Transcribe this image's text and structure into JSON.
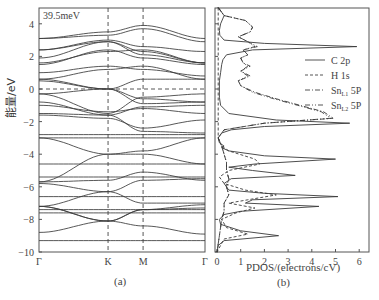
{
  "figure": {
    "panel_a_label": "(a)",
    "panel_b_label": "(b)",
    "annotation": "39.5meV",
    "ylabel": "能量/eV",
    "xlabel_b": "PDOS/(electrons/cV)"
  },
  "chart_data": [
    {
      "type": "line",
      "title": "Band structure",
      "panel": "(a)",
      "xlabel": "",
      "ylabel": "能量/eV",
      "ylim": [
        -10,
        5
      ],
      "yticks": [
        4,
        2,
        0,
        -2,
        -4,
        -6,
        -8,
        -10
      ],
      "k_points": [
        "Γ",
        "K",
        "M",
        "Γ"
      ],
      "k_positions": [
        0,
        0.416,
        0.627,
        1.0
      ],
      "fermi_level": 0,
      "annotation": "39.5meV",
      "bands": [
        [
          3.1,
          3.5,
          3.9,
          3.1
        ],
        [
          3.1,
          3.3,
          3.7,
          2.9
        ],
        [
          2.4,
          3.0,
          2.6,
          2.3
        ],
        [
          2.4,
          2.9,
          2.3,
          1.6
        ],
        [
          1.9,
          2.9,
          2.1,
          1.6
        ],
        [
          1.6,
          2.3,
          2.4,
          1.6
        ],
        [
          1.5,
          2.4,
          1.9,
          1.5
        ],
        [
          1.0,
          1.4,
          1.2,
          0.8
        ],
        [
          0.6,
          1.2,
          1.4,
          0.6
        ],
        [
          0.6,
          0.0,
          0.6,
          0.6
        ],
        [
          0.5,
          -0.0,
          -0.6,
          -0.8
        ],
        [
          -0.3,
          0.0,
          -0.9,
          -0.8
        ],
        [
          -0.3,
          -1.5,
          -0.5,
          -0.3
        ],
        [
          -0.8,
          -1.6,
          -1.1,
          -1.0
        ],
        [
          -1.0,
          -1.4,
          -1.2,
          -1.5
        ],
        [
          -1.5,
          -1.6,
          -2.6,
          -2.7
        ],
        [
          -1.6,
          -1.8,
          -2.4,
          -1.9
        ],
        [
          -2.8,
          -2.8,
          -2.8,
          -2.8
        ],
        [
          -3.0,
          -3.0,
          -3.0,
          -3.0
        ],
        [
          -3.0,
          -4.0,
          -3.8,
          -3.0
        ],
        [
          -4.6,
          -4.6,
          -4.6,
          -4.6
        ],
        [
          -5.7,
          -4.0,
          -4.0,
          -4.6
        ],
        [
          -5.7,
          -5.6,
          -5.1,
          -5.6
        ],
        [
          -5.4,
          -5.4,
          -5.4,
          -5.4
        ],
        [
          -5.8,
          -6.3,
          -5.6,
          -5.5
        ],
        [
          -6.6,
          -6.6,
          -6.6,
          -6.6
        ],
        [
          -7.2,
          -6.3,
          -7.0,
          -7.0
        ],
        [
          -7.2,
          -8.1,
          -7.4,
          -7.3
        ],
        [
          -7.4,
          -7.4,
          -7.4,
          -7.4
        ],
        [
          -7.6,
          -7.6,
          -7.6,
          -7.6
        ],
        [
          -8.8,
          -8.1,
          -7.4,
          -7.1
        ],
        [
          -9.3,
          -9.3,
          -9.3,
          -9.3
        ],
        [
          -7.2,
          -8.1,
          -8.4,
          -8.9
        ]
      ]
    },
    {
      "type": "line",
      "title": "Projected density of states",
      "panel": "(b)",
      "xlabel": "PDOS/(electrons/cV)",
      "ylabel": "",
      "xlim": [
        0,
        6.4
      ],
      "xticks": [
        0,
        1,
        2,
        3,
        4,
        5,
        6
      ],
      "ylim": [
        -10,
        5
      ],
      "legend_position": "right",
      "legend": [
        "C 2p",
        "H 1s",
        "Sn_L1 5P",
        "Sn_L2 5P"
      ],
      "series": [
        {
          "name": "C 2p",
          "style": "solid",
          "energy": [
            5.0,
            4.5,
            4.0,
            3.6,
            3.3,
            3.0,
            2.8,
            2.6,
            2.4,
            2.1,
            1.8,
            1.5,
            1.0,
            0.5,
            0.0,
            -0.5,
            -1.0,
            -1.5,
            -1.9,
            -2.1,
            -2.3,
            -2.5,
            -2.7,
            -3.0,
            -3.3,
            -3.5,
            -3.6,
            -3.8,
            -4.1,
            -4.3,
            -4.6,
            -4.8,
            -5.0,
            -5.3,
            -5.5,
            -5.8,
            -6.2,
            -6.4,
            -6.6,
            -6.8,
            -7.0,
            -7.2,
            -7.5,
            -7.7,
            -8.0,
            -8.3,
            -8.7,
            -9.0,
            -9.3,
            -9.6,
            -10.0
          ],
          "pdos": [
            0.05,
            0.3,
            0.15,
            0.1,
            0.12,
            0.3,
            2.0,
            5.9,
            1.5,
            0.4,
            0.25,
            0.2,
            0.15,
            0.1,
            0.1,
            0.1,
            0.15,
            0.5,
            2.5,
            5.6,
            2.0,
            0.6,
            0.2,
            0.05,
            0.1,
            0.3,
            0.2,
            0.5,
            2.0,
            5.0,
            1.6,
            0.5,
            1.5,
            3.3,
            0.6,
            0.3,
            0.5,
            2.0,
            5.1,
            1.5,
            1.2,
            4.3,
            1.0,
            0.3,
            0.1,
            0.15,
            1.0,
            2.6,
            0.3,
            0.05,
            0.0
          ]
        },
        {
          "name": "H 1s",
          "style": "dashed",
          "energy": [
            5.0,
            3.0,
            2.6,
            0.0,
            -3.0,
            -3.5,
            -3.8,
            -4.3,
            -4.6,
            -5.0,
            -5.4,
            -5.8,
            -6.2,
            -6.5,
            -6.8,
            -7.0,
            -7.3,
            -7.6,
            -8.0,
            -8.5,
            -8.9,
            -9.2,
            -10.0
          ],
          "pdos": [
            0.05,
            0.05,
            0.05,
            0.05,
            0.05,
            0.2,
            0.5,
            1.6,
            1.8,
            0.5,
            0.1,
            0.3,
            1.2,
            2.5,
            1.3,
            0.5,
            1.6,
            0.8,
            0.2,
            0.4,
            1.3,
            0.3,
            0.0
          ]
        },
        {
          "name": "Sn_L1 5P",
          "style": "dashdot",
          "energy": [
            5.0,
            4.5,
            4.2,
            3.8,
            3.5,
            3.2,
            2.9,
            2.6,
            2.4,
            2.1,
            1.9,
            1.6,
            1.4,
            1.1,
            0.8,
            0.5,
            0.2,
            -0.2,
            -0.6,
            -1.0,
            -1.4,
            -1.8,
            -2.1,
            -2.5,
            -3.0,
            -3.5,
            -4.0,
            -4.5,
            -5.0,
            -5.5,
            -6.0,
            -6.5,
            -7.0,
            -7.5,
            -8.0,
            -9.0,
            -10.0
          ],
          "pdos": [
            0.05,
            0.3,
            1.2,
            1.5,
            1.4,
            0.9,
            1.3,
            1.7,
            1.1,
            1.3,
            1.0,
            1.1,
            1.4,
            1.0,
            1.4,
            0.9,
            1.0,
            1.6,
            2.5,
            3.5,
            4.5,
            4.9,
            2.0,
            0.3,
            0.05,
            0.2,
            0.3,
            0.4,
            0.4,
            0.5,
            0.4,
            0.5,
            0.3,
            0.3,
            0.2,
            0.1,
            0.0
          ]
        },
        {
          "name": "Sn_L2 5P",
          "style": "dashdotdot",
          "energy": [
            5.0,
            4.5,
            4.2,
            3.8,
            3.5,
            3.2,
            2.9,
            2.6,
            2.4,
            2.1,
            1.9,
            1.6,
            1.4,
            1.1,
            0.8,
            0.5,
            0.2,
            -0.2,
            -0.6,
            -1.0,
            -1.4,
            -1.8,
            -2.1,
            -2.5,
            -3.0,
            -3.5,
            -4.0,
            -4.5,
            -5.0,
            -5.5,
            -6.0,
            -6.5,
            -7.0,
            -7.5,
            -8.0,
            -9.0,
            -10.0
          ],
          "pdos": [
            0.05,
            0.3,
            1.2,
            1.5,
            1.4,
            0.9,
            1.3,
            1.6,
            1.1,
            1.3,
            1.0,
            1.1,
            1.3,
            1.0,
            1.3,
            0.9,
            1.0,
            1.5,
            2.4,
            3.4,
            4.4,
            4.8,
            2.0,
            0.3,
            0.05,
            0.2,
            0.3,
            0.4,
            0.4,
            0.5,
            0.4,
            0.5,
            0.3,
            0.3,
            0.2,
            0.1,
            0.0
          ]
        }
      ]
    }
  ]
}
